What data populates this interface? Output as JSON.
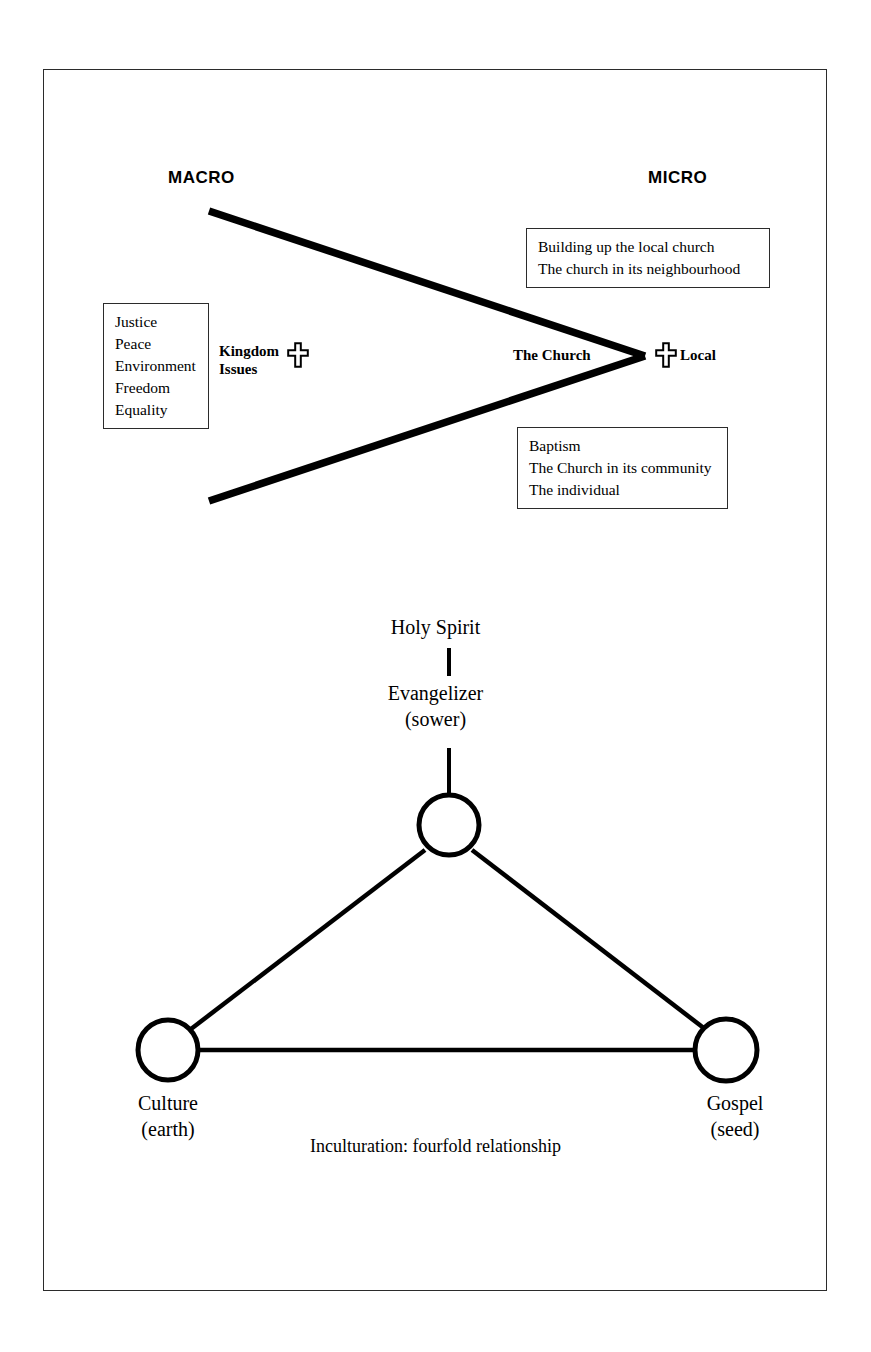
{
  "figure": {
    "caption": "Inculturation: fourfold relationship"
  },
  "top_diagram": {
    "headings": {
      "macro": "MACRO",
      "micro": "MICRO"
    },
    "boxes": [
      {
        "id": "building",
        "lines": [
          "Building up the local church",
          "The church in its neighbourhood"
        ]
      },
      {
        "id": "kingdom",
        "lines": [
          "Justice",
          "Peace",
          "Environment",
          "Freedom",
          "Equality"
        ]
      },
      {
        "id": "baptism",
        "lines": [
          "Baptism",
          "The Church in its community",
          "The individual"
        ]
      }
    ],
    "labels": {
      "kingdom_issues_line1": "Kingdom",
      "kingdom_issues_line2": "Issues",
      "the_church": "The Church",
      "local": "Local"
    },
    "icons": {
      "kingdom_cross": "cross-icon",
      "local_cross": "cross-icon"
    }
  },
  "bottom_diagram": {
    "nodes": {
      "holy_spirit": "Holy Spirit",
      "evangelizer_line1": "Evangelizer",
      "evangelizer_line2": "(sower)",
      "culture_line1": "Culture",
      "culture_line2": "(earth)",
      "gospel_line1": "Gospel",
      "gospel_line2": "(seed)"
    }
  },
  "colors": {
    "ink": "#000000",
    "frame": "#2b2b2b",
    "background": "#ffffff"
  }
}
